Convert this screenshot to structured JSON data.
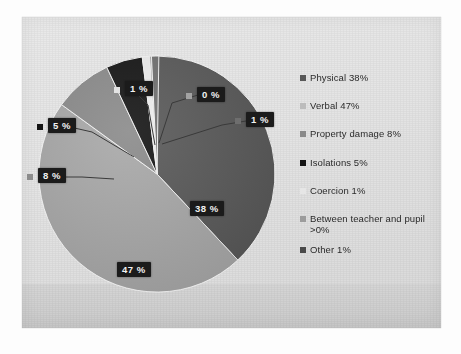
{
  "chart_data": {
    "type": "pie",
    "title": "",
    "legend_position": "right",
    "categories": [
      "Physical",
      "Verbal",
      "Property damage",
      "Isolations",
      "Coercion",
      "Between teacher and pupil",
      "Other"
    ],
    "values": [
      38,
      47,
      8,
      5,
      1,
      0,
      1
    ],
    "value_labels": [
      "38 %",
      "47 %",
      "8 %",
      "5 %",
      "1 %",
      "0 %",
      "1 %"
    ],
    "colors": [
      "#585858",
      "#a8a8a8",
      "#8a8a8a",
      "#141414",
      "#ededed",
      "#9c9c9c",
      "#707070"
    ],
    "legend": [
      {
        "label": "Physical 38%",
        "color": "#585858"
      },
      {
        "label": "Verbal 47%",
        "color": "#b4b4b4"
      },
      {
        "label": "Property damage 8%",
        "color": "#8a8a8a"
      },
      {
        "label": "Isolations 5%",
        "color": "#141414"
      },
      {
        "label": "Coercion 1%",
        "color": "#ededed"
      },
      {
        "label": "Between teacher and pupil",
        "color": "#9c9c9c"
      },
      {
        "label": ">0%",
        "color": ""
      },
      {
        "label": "Other 1%",
        "color": "#4a4a4a"
      }
    ]
  },
  "callouts": {
    "physical": "38 %",
    "verbal": "47 %",
    "property_damage": "8 %",
    "isolations": "5 %",
    "coercion": "1 %",
    "between_teacher_and_pupil": "0 %",
    "other": "1 %"
  },
  "legend_labels": {
    "physical": "Physical 38%",
    "verbal": "Verbal 47%",
    "property_damage": "Property damage 8%",
    "isolations": "Isolations 5%",
    "coercion": "Coercion 1%",
    "between_line1": "Between teacher and pupil",
    "between_line2": ">0%",
    "other": "Other 1%"
  }
}
